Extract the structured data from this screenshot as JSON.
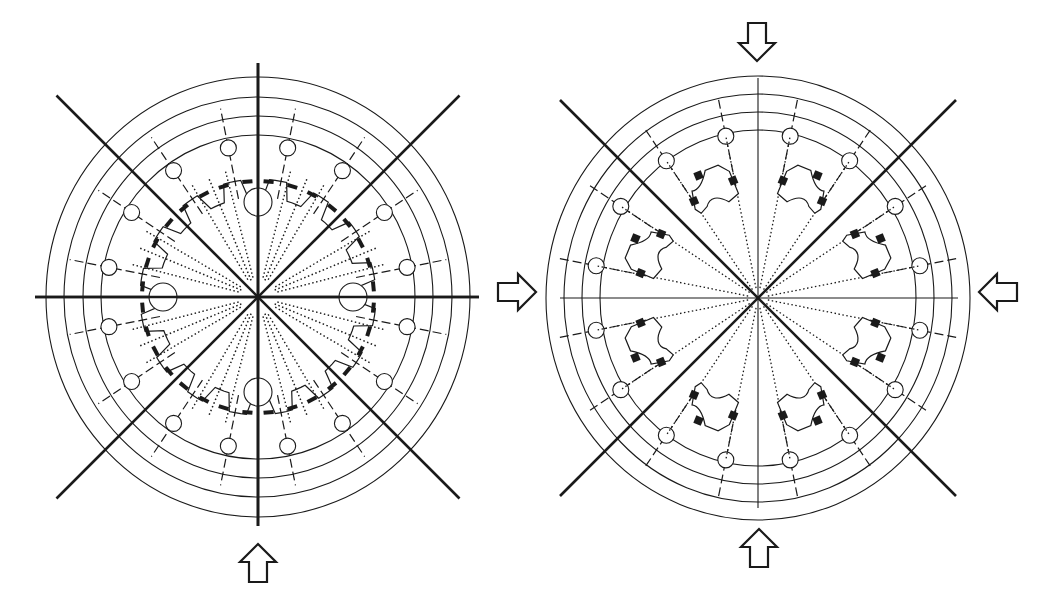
{
  "figure": {
    "stroke_color": "#1a1a1a",
    "background": "#ffffff"
  },
  "left_diagram": {
    "name": "gear-ring-clamp-layout",
    "center": [
      258,
      297
    ],
    "rings": [
      {
        "rx": 157,
        "ry": 162
      },
      {
        "rx": 175,
        "ry": 181
      },
      {
        "rx": 194,
        "ry": 200
      },
      {
        "rx": 212,
        "ry": 220
      }
    ],
    "axes": {
      "horizontal": [
        35,
        479
      ],
      "vertical": [
        63,
        526
      ],
      "diagonal_half_length": 285
    },
    "holes": {
      "count": 16,
      "radius_from_center": 152,
      "hole_radius": 8,
      "start_angle_deg": 11.25,
      "step_deg": 22.5
    },
    "dashed_radials": {
      "inner": 100,
      "outer": 192
    },
    "dotted_radials": {
      "count": 16,
      "inner": 18,
      "outer": 128,
      "start_angle_deg": 22.5,
      "step_deg": 22.5
    },
    "arrows": [
      {
        "direction": "up",
        "x": 258,
        "y": 563
      }
    ]
  },
  "right_diagram": {
    "name": "split-segment-clamp-layout",
    "center": [
      758,
      298
    ],
    "rings": [
      {
        "rx": 158,
        "ry": 168
      },
      {
        "rx": 176,
        "ry": 186
      },
      {
        "rx": 194,
        "ry": 204
      },
      {
        "rx": 212,
        "ry": 222
      }
    ],
    "axes": {
      "horizontal": [
        560,
        958
      ],
      "vertical": [
        78,
        508
      ],
      "diagonal_half_length": 280
    },
    "holes": {
      "count": 16,
      "radius_from_center": 165,
      "hole_radius": 8,
      "start_angle_deg": 11.25,
      "step_deg": 22.5
    },
    "arrows": [
      {
        "direction": "down",
        "x": 757,
        "y": 42
      },
      {
        "direction": "up",
        "x": 759,
        "y": 548
      },
      {
        "direction": "left",
        "x": 998,
        "y": 292
      },
      {
        "direction": "right",
        "x": 517,
        "y": 292
      }
    ]
  }
}
